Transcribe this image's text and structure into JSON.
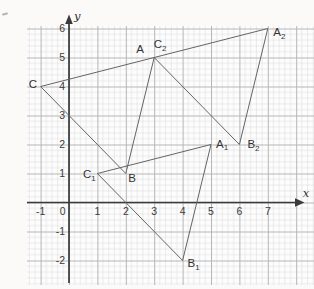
{
  "figure_title": "translation-diagram-on-graph-paper",
  "colors": {
    "paper": "#fdfdfd",
    "page_background": "#fbfaf9",
    "grid_fine": "#dcdcdc",
    "grid_bold": "#b6b6b6",
    "axis": "#3a3a3a",
    "triangle_stroke": "#646464",
    "label_text": "#333333"
  },
  "chart_data": {
    "type": "geometry-diagram",
    "axes": {
      "x_label": "x",
      "y_label": "y",
      "x_range": [
        -1.5,
        8.6
      ],
      "y_range": [
        -2.9,
        6.4
      ],
      "grid": "fine graph paper, bold line every unit"
    },
    "x_ticks": [
      {
        "label": "-1",
        "v": -1
      },
      {
        "label": "0",
        "v": 0,
        "anchor": "end",
        "dx": -3.5
      },
      {
        "label": "1",
        "v": 1
      },
      {
        "label": "2",
        "v": 2
      },
      {
        "label": "3",
        "v": 3
      },
      {
        "label": "4",
        "v": 4
      },
      {
        "label": "5",
        "v": 5
      },
      {
        "label": "6",
        "v": 6
      },
      {
        "label": "7",
        "v": 7
      }
    ],
    "y_ticks": [
      {
        "label": "6",
        "v": 6
      },
      {
        "label": "5",
        "v": 5
      },
      {
        "label": "4",
        "v": 4
      },
      {
        "label": "3",
        "v": 3
      },
      {
        "label": "2",
        "v": 2
      },
      {
        "label": "1",
        "v": 1
      },
      {
        "label": "-1",
        "v": -1
      },
      {
        "label": "-2",
        "v": -2
      }
    ],
    "triangles": [
      {
        "name": "ABC",
        "vertices": [
          {
            "label": "A",
            "sub": "",
            "x": 3,
            "y": 5,
            "anchor": "middle",
            "dx": -14,
            "dy": -4.5
          },
          {
            "label": "B",
            "sub": "",
            "x": 2,
            "y": 1,
            "anchor": "start",
            "dx": 2.5,
            "dy": 8
          },
          {
            "label": "C",
            "sub": "",
            "x": -1,
            "y": 4,
            "anchor": "end",
            "dx": -3.5,
            "dy": 1
          }
        ]
      },
      {
        "name": "A1B1C1",
        "vertices": [
          {
            "label": "A",
            "sub": "1",
            "x": 5,
            "y": 2,
            "anchor": "start",
            "dx": 5,
            "dy": 3
          },
          {
            "label": "B",
            "sub": "1",
            "x": 4,
            "y": -2,
            "anchor": "start",
            "dx": 5,
            "dy": 6.5
          },
          {
            "label": "C",
            "sub": "1",
            "x": 1,
            "y": 1,
            "anchor": "start",
            "dx": -14.5,
            "dy": 4.5
          }
        ]
      },
      {
        "name": "A2B2C2",
        "vertices": [
          {
            "label": "A",
            "sub": "2",
            "x": 7,
            "y": 6,
            "anchor": "start",
            "dx": 5.5,
            "dy": 7.5
          },
          {
            "label": "B",
            "sub": "2",
            "x": 6,
            "y": 2,
            "anchor": "start",
            "dx": 8,
            "dy": 3.5
          },
          {
            "label": "C",
            "sub": "2",
            "x": 3,
            "y": 5,
            "anchor": "start",
            "dx": -0.5,
            "dy": -9.5
          }
        ]
      }
    ]
  }
}
